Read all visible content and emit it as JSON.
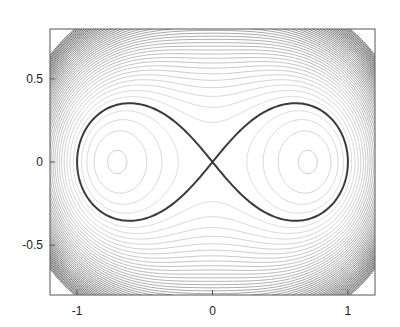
{
  "chart_data": {
    "type": "line",
    "title": "",
    "xlabel": "",
    "ylabel": "",
    "xlim": [
      -1.2,
      1.2
    ],
    "ylim": [
      -0.8,
      0.8
    ],
    "grid": false,
    "legend": null,
    "xticks": [
      -1,
      0,
      1
    ],
    "xtick_labels": [
      "-1",
      "0",
      "1"
    ],
    "yticks": [
      -0.5,
      0,
      0.5
    ],
    "ytick_labels": [
      "-0.5",
      "0",
      "0.5"
    ],
    "series": [
      {
        "name": "lemniscate",
        "description": "Lemniscate of Bernoulli (x^2+y^2)^2 = x^2 - y^2",
        "color": "#444444",
        "x": [
          1.0,
          0.95,
          0.87,
          0.707,
          0.5,
          0.3,
          0.0,
          -0.3,
          -0.5,
          -0.707,
          -0.87,
          -0.95,
          -1.0
        ],
        "y": [
          0.0,
          0.28,
          0.4,
          0.5,
          0.44,
          0.28,
          0.0,
          0.28,
          0.44,
          0.5,
          0.4,
          0.28,
          0.0
        ]
      }
    ],
    "background_contours": {
      "function": "(x^2+y^2)^2 - (x^2 - y^2)",
      "color": "#888888",
      "levels_visible": "many; denser toward the corners"
    }
  },
  "axes": {
    "x_tick_labels": [
      "-1",
      "0",
      "1"
    ],
    "y_tick_labels": [
      "0.5",
      "0",
      "-0.5"
    ]
  }
}
